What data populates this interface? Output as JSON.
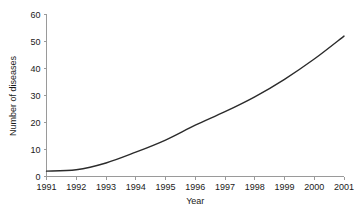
{
  "chart_data": {
    "type": "line",
    "title": "",
    "xlabel": "Year",
    "ylabel": "Number of diseases",
    "categories": [
      "1991",
      "1992",
      "1993",
      "1994",
      "1995",
      "1996",
      "1997",
      "1998",
      "1999",
      "2000",
      "2001"
    ],
    "x": [
      1991,
      1992,
      1993,
      1994,
      1995,
      1996,
      1997,
      1998,
      1999,
      2000,
      2001
    ],
    "values": [
      2,
      2.5,
      5,
      9,
      13.5,
      19,
      24,
      29.5,
      36,
      43.5,
      52
    ],
    "series": [
      {
        "name": "Number of diseases",
        "values": [
          2,
          2.5,
          5,
          9,
          13.5,
          19,
          24,
          29.5,
          36,
          43.5,
          52
        ]
      }
    ],
    "xlim": [
      1991,
      2001
    ],
    "ylim": [
      0,
      60
    ],
    "yticks": [
      0,
      10,
      20,
      30,
      40,
      50,
      60
    ],
    "ytick_labels": [
      "0",
      "10",
      "20",
      "30",
      "40",
      "50",
      "60"
    ],
    "xtick_labels": [
      "1991",
      "1992",
      "1993",
      "1994",
      "1995",
      "1996",
      "1997",
      "1998",
      "1999",
      "2000",
      "2001"
    ],
    "grid": false,
    "legend": false,
    "legend_position": "none",
    "line_color": "#2b2b2b",
    "axis_color": "#9a9a9a",
    "background_color": "#ffffff"
  },
  "axes": {
    "y_label": "Number of diseases",
    "x_label": "Year",
    "y_ticks": [
      {
        "label": "60",
        "value": 60
      },
      {
        "label": "50",
        "value": 50
      },
      {
        "label": "40",
        "value": 40
      },
      {
        "label": "30",
        "value": 30
      },
      {
        "label": "20",
        "value": 20
      },
      {
        "label": "10",
        "value": 10
      },
      {
        "label": "0",
        "value": 0
      }
    ],
    "x_ticks": [
      {
        "label": "1991",
        "value": 1991
      },
      {
        "label": "1992",
        "value": 1992
      },
      {
        "label": "1993",
        "value": 1993
      },
      {
        "label": "1994",
        "value": 1994
      },
      {
        "label": "1995",
        "value": 1995
      },
      {
        "label": "1996",
        "value": 1996
      },
      {
        "label": "1997",
        "value": 1997
      },
      {
        "label": "1998",
        "value": 1998
      },
      {
        "label": "1999",
        "value": 1999
      },
      {
        "label": "2000",
        "value": 2000
      },
      {
        "label": "2001",
        "value": 2001
      }
    ]
  }
}
